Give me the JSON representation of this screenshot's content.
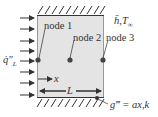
{
  "diagram": {
    "type": "1D conduction finite-difference schematic",
    "colors": {
      "slab_fill": "#e4e4e4",
      "slab_stroke": "#888888",
      "ink": "#333333"
    },
    "labels": {
      "node1": "node 1",
      "node2": "node 2",
      "node3": "node 3",
      "heat_flux": "q̇″",
      "heat_flux_sub": "L",
      "convection": "h̄,T",
      "convection_sub": "∞",
      "x_axis": "x",
      "length": "L",
      "generation": "g‴ = ax,k"
    },
    "nodes": [
      {
        "id": "node1",
        "position": "left boundary"
      },
      {
        "id": "node2",
        "position": "center"
      },
      {
        "id": "node3",
        "position": "right boundary"
      }
    ],
    "boundaries": {
      "top": "insulated (hatched)",
      "bottom": "insulated (hatched)",
      "left": "prescribed heat flux",
      "right": "convection"
    },
    "flux_arrow_count": 8
  }
}
